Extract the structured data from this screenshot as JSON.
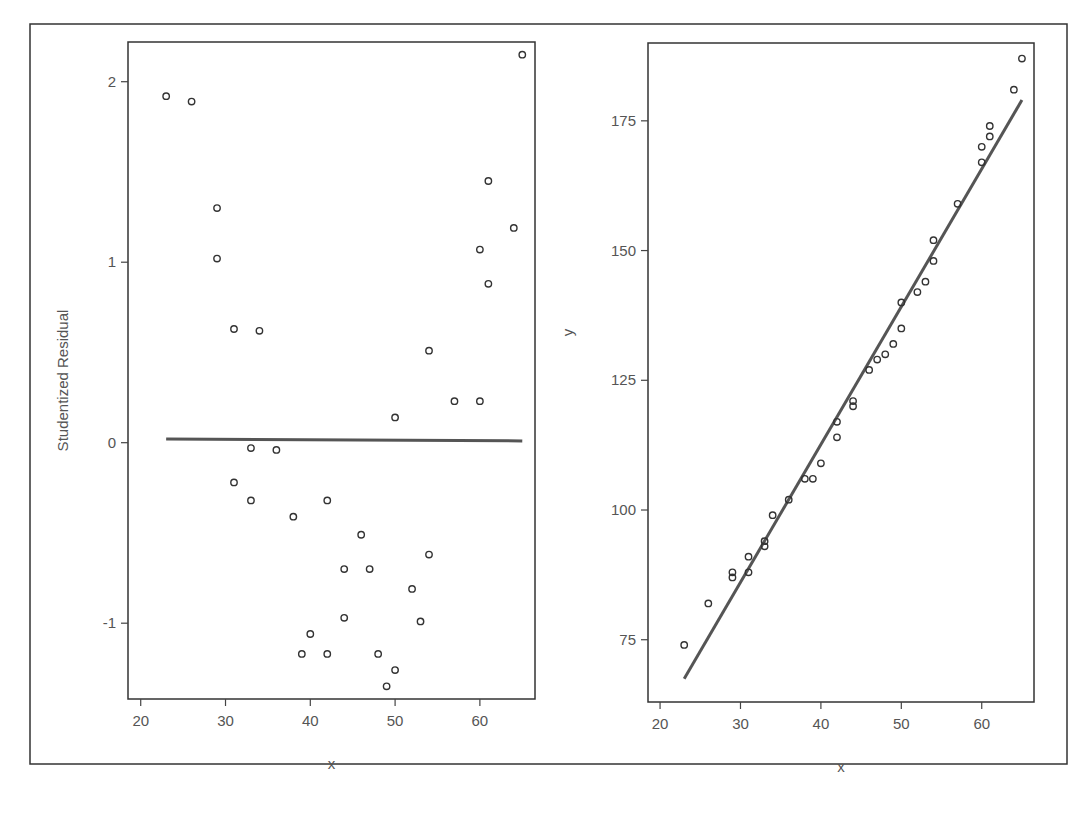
{
  "figure": {
    "outer_frame": {
      "x": 30,
      "y": 24,
      "w": 1037,
      "h": 740
    },
    "colors": {
      "frame": "#333333",
      "axis": "#444444",
      "marker": "#333333",
      "fit_line": "#555555",
      "text": "#555555",
      "background": "#ffffff"
    }
  },
  "chart_data": [
    {
      "type": "scatter",
      "title": "",
      "xlabel": "x",
      "ylabel": "Studentized Residual",
      "xlim": [
        18.5,
        66.5
      ],
      "ylim": [
        -1.42,
        2.22
      ],
      "x_ticks": [
        20,
        30,
        40,
        50,
        60
      ],
      "x_tick_labels": [
        "20",
        "30",
        "40",
        "50",
        "60"
      ],
      "y_ticks": [
        -1,
        0,
        1,
        2
      ],
      "y_tick_labels": [
        "-1",
        "0",
        "1",
        "2"
      ],
      "grid": false,
      "legend": null,
      "reference_line": {
        "x": [
          23,
          65
        ],
        "y": [
          0.02,
          0.01
        ],
        "label": "zero residual line"
      },
      "points": [
        {
          "x": 23,
          "y": 1.92
        },
        {
          "x": 26,
          "y": 1.89
        },
        {
          "x": 29,
          "y": 1.3
        },
        {
          "x": 29,
          "y": 1.02
        },
        {
          "x": 31,
          "y": 0.63
        },
        {
          "x": 34,
          "y": 0.62
        },
        {
          "x": 33,
          "y": -0.03
        },
        {
          "x": 36,
          "y": -0.04
        },
        {
          "x": 31,
          "y": -0.22
        },
        {
          "x": 33,
          "y": -0.32
        },
        {
          "x": 38,
          "y": -0.41
        },
        {
          "x": 42,
          "y": -0.32
        },
        {
          "x": 46,
          "y": -0.51
        },
        {
          "x": 44,
          "y": -0.7
        },
        {
          "x": 47,
          "y": -0.7
        },
        {
          "x": 54,
          "y": -0.62
        },
        {
          "x": 52,
          "y": -0.81
        },
        {
          "x": 44,
          "y": -0.97
        },
        {
          "x": 53,
          "y": -0.99
        },
        {
          "x": 40,
          "y": -1.06
        },
        {
          "x": 39,
          "y": -1.17
        },
        {
          "x": 42,
          "y": -1.17
        },
        {
          "x": 48,
          "y": -1.17
        },
        {
          "x": 50,
          "y": -1.26
        },
        {
          "x": 49,
          "y": -1.35
        },
        {
          "x": 50,
          "y": 0.14
        },
        {
          "x": 54,
          "y": 0.51
        },
        {
          "x": 57,
          "y": 0.23
        },
        {
          "x": 60,
          "y": 0.23
        },
        {
          "x": 60,
          "y": 1.07
        },
        {
          "x": 61,
          "y": 0.88
        },
        {
          "x": 61,
          "y": 1.45
        },
        {
          "x": 64,
          "y": 1.19
        },
        {
          "x": 65,
          "y": 2.15
        }
      ]
    },
    {
      "type": "scatter",
      "title": "",
      "xlabel": "x",
      "ylabel": "y",
      "xlim": [
        18.5,
        66.5
      ],
      "ylim": [
        63,
        190
      ],
      "x_ticks": [
        20,
        30,
        40,
        50,
        60
      ],
      "x_tick_labels": [
        "20",
        "30",
        "40",
        "50",
        "60"
      ],
      "y_ticks": [
        75,
        100,
        125,
        150,
        175
      ],
      "y_tick_labels": [
        "75",
        "100",
        "125",
        "150",
        "175"
      ],
      "grid": false,
      "legend": null,
      "fit_line": {
        "x": [
          23,
          65
        ],
        "y": [
          67.5,
          179
        ],
        "label": "least-squares fit"
      },
      "points": [
        {
          "x": 23,
          "y": 74
        },
        {
          "x": 26,
          "y": 82
        },
        {
          "x": 29,
          "y": 87
        },
        {
          "x": 29,
          "y": 88
        },
        {
          "x": 31,
          "y": 88
        },
        {
          "x": 31,
          "y": 91
        },
        {
          "x": 33,
          "y": 93
        },
        {
          "x": 33,
          "y": 94
        },
        {
          "x": 34,
          "y": 99
        },
        {
          "x": 36,
          "y": 102
        },
        {
          "x": 38,
          "y": 106
        },
        {
          "x": 39,
          "y": 106
        },
        {
          "x": 40,
          "y": 109
        },
        {
          "x": 42,
          "y": 114
        },
        {
          "x": 42,
          "y": 117
        },
        {
          "x": 44,
          "y": 120
        },
        {
          "x": 44,
          "y": 121
        },
        {
          "x": 46,
          "y": 127
        },
        {
          "x": 47,
          "y": 129
        },
        {
          "x": 48,
          "y": 130
        },
        {
          "x": 49,
          "y": 132
        },
        {
          "x": 50,
          "y": 135
        },
        {
          "x": 50,
          "y": 140
        },
        {
          "x": 52,
          "y": 142
        },
        {
          "x": 53,
          "y": 144
        },
        {
          "x": 54,
          "y": 148
        },
        {
          "x": 54,
          "y": 152
        },
        {
          "x": 57,
          "y": 159
        },
        {
          "x": 60,
          "y": 167
        },
        {
          "x": 60,
          "y": 170
        },
        {
          "x": 61,
          "y": 172
        },
        {
          "x": 61,
          "y": 174
        },
        {
          "x": 64,
          "y": 181
        },
        {
          "x": 65,
          "y": 187
        }
      ]
    }
  ],
  "panels": [
    {
      "name": "residual-plot",
      "frame": {
        "x": 128,
        "y": 42,
        "w": 407,
        "h": 657
      },
      "tick_length": 7
    },
    {
      "name": "fit-plot",
      "frame": {
        "x": 648,
        "y": 43,
        "w": 386,
        "h": 659
      },
      "tick_length": 7
    }
  ]
}
